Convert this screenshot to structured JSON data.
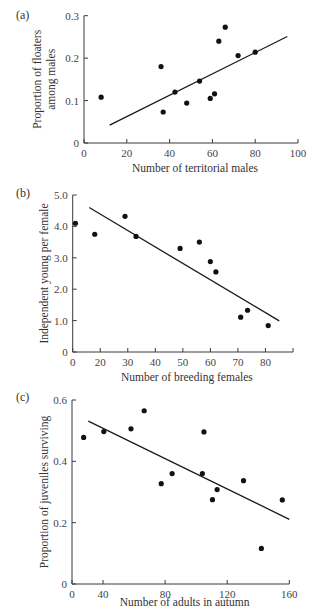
{
  "figure": {
    "panels": [
      "(a)",
      "(b)",
      "(c)"
    ]
  },
  "chart_data": [
    {
      "type": "scatter",
      "panel": "(a)",
      "title": "",
      "xlabel": "Number of territorial males",
      "ylabel": [
        "Proportion of floaters",
        "among males"
      ],
      "xticks": [
        0,
        20,
        40,
        60,
        80,
        100
      ],
      "xtick_labels": [
        "0",
        "20",
        "40",
        "60",
        "80",
        "100"
      ],
      "yticks": [
        0,
        0.1,
        0.2,
        0.3
      ],
      "ytick_labels": [
        "0",
        "0.1",
        "0.2",
        "0.3"
      ],
      "xlim": [
        0,
        100
      ],
      "ylim": [
        0,
        0.3
      ],
      "grid": false,
      "points": [
        {
          "x": 8,
          "y": 0.108
        },
        {
          "x": 36,
          "y": 0.18
        },
        {
          "x": 37,
          "y": 0.073
        },
        {
          "x": 42.5,
          "y": 0.12
        },
        {
          "x": 48,
          "y": 0.094
        },
        {
          "x": 54,
          "y": 0.146
        },
        {
          "x": 59,
          "y": 0.105
        },
        {
          "x": 61,
          "y": 0.116
        },
        {
          "x": 63,
          "y": 0.24
        },
        {
          "x": 66,
          "y": 0.273
        },
        {
          "x": 72,
          "y": 0.206
        },
        {
          "x": 80,
          "y": 0.214
        }
      ],
      "fit_line": {
        "x1": 12,
        "y1": 0.042,
        "x2": 95,
        "y2": 0.251
      }
    },
    {
      "type": "scatter",
      "panel": "(b)",
      "title": "",
      "xlabel": "Number of breeding females",
      "ylabel": [
        "Independent young per female"
      ],
      "xticks": [
        0,
        10,
        20,
        30,
        40,
        50,
        60,
        70,
        80
      ],
      "xtick_labels": [
        "0",
        "20",
        "30",
        "40",
        "50",
        "60",
        "70",
        "80"
      ],
      "xtick_positions_note": "first non-zero tick labeled 20 sits at 10-unit spacing as printed",
      "yticks": [
        0,
        1.0,
        2.0,
        3.0,
        4.0,
        5.0
      ],
      "ytick_labels": [
        "0",
        "1.0",
        "2.0",
        "3.0",
        "4.0",
        "5.0"
      ],
      "xlim": [
        0,
        80
      ],
      "ylim": [
        0,
        5.0
      ],
      "grid": false,
      "points": [
        {
          "x": 1,
          "y": 4.1
        },
        {
          "x": 8,
          "y": 3.75
        },
        {
          "x": 19,
          "y": 4.32
        },
        {
          "x": 23,
          "y": 3.68
        },
        {
          "x": 39,
          "y": 3.3
        },
        {
          "x": 46,
          "y": 3.5
        },
        {
          "x": 50,
          "y": 2.88
        },
        {
          "x": 52,
          "y": 2.55
        },
        {
          "x": 61,
          "y": 1.11
        },
        {
          "x": 63.5,
          "y": 1.33
        },
        {
          "x": 71,
          "y": 0.84
        }
      ],
      "fit_line": {
        "x1": 6,
        "y1": 4.6,
        "x2": 75,
        "y2": 0.99
      }
    },
    {
      "type": "scatter",
      "panel": "(c)",
      "title": "",
      "xlabel": "Number of adults in autumn",
      "ylabel": [
        "Proportion of juveniles surviving"
      ],
      "xticks": [
        0,
        20,
        60,
        100,
        140
      ],
      "xtick_labels": [
        "0",
        "40",
        "80",
        "120",
        "160"
      ],
      "xtick_positions_note": "first non-zero tick labeled 40 sits at half spacing as printed",
      "yticks": [
        0,
        0.2,
        0.4,
        0.6
      ],
      "ytick_labels": [
        "0",
        "0.2",
        "0.4",
        "0.6"
      ],
      "xlim": [
        0,
        140
      ],
      "ylim": [
        0,
        0.6
      ],
      "grid": false,
      "points": [
        {
          "x": 7.5,
          "y": 0.478
        },
        {
          "x": 20.5,
          "y": 0.497
        },
        {
          "x": 38,
          "y": 0.506
        },
        {
          "x": 46.5,
          "y": 0.565
        },
        {
          "x": 57.5,
          "y": 0.327
        },
        {
          "x": 64.5,
          "y": 0.36
        },
        {
          "x": 84,
          "y": 0.36
        },
        {
          "x": 85,
          "y": 0.496
        },
        {
          "x": 90.5,
          "y": 0.275
        },
        {
          "x": 93.5,
          "y": 0.308
        },
        {
          "x": 110.5,
          "y": 0.337
        },
        {
          "x": 122,
          "y": 0.116
        },
        {
          "x": 135.5,
          "y": 0.274
        }
      ],
      "printed_x_values": [
        15,
        41,
        58,
        67,
        77,
        84,
        104,
        105,
        111,
        113,
        131,
        142,
        156
      ],
      "fit_line": {
        "x1": 10.5,
        "y1": 0.531,
        "x2": 140,
        "y2": 0.211
      }
    }
  ],
  "layout": [
    {
      "left": 84,
      "right": 298,
      "top": 15.7,
      "bottom": 143,
      "label_x": 16,
      "label_y": 19,
      "ylabel_x": 44,
      "xtitle_y": 172
    },
    {
      "left": 72.7,
      "right": 293,
      "top": 195,
      "bottom": 352,
      "label_x": 16,
      "label_y": 197,
      "ylabel_x": 44,
      "xtitle_y": 381
    },
    {
      "left": 72,
      "right": 289.3,
      "top": 400,
      "bottom": 584,
      "label_x": 16,
      "label_y": 401,
      "ylabel_x": 44,
      "xtitle_y": 606
    }
  ]
}
